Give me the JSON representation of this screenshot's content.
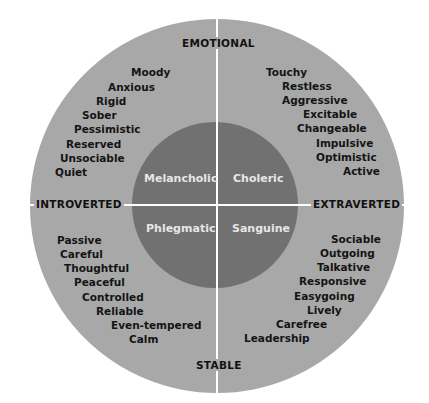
{
  "colors": {
    "outer": "#a8a8a8",
    "inner": "#717171",
    "lines": "#ffffff",
    "text": "#141414",
    "inner_text": "#e6e6e6"
  },
  "axes": {
    "top": "EMOTIONAL",
    "bottom": "STABLE",
    "left": "INTROVERTED",
    "right": "EXTRAVERTED"
  },
  "temperaments": {
    "top_left": "Melancholic",
    "top_right": "Choleric",
    "bottom_left": "Phlegmatic",
    "bottom_right": "Sanguine"
  },
  "traits": {
    "melancholic": [
      "Moody",
      "Anxious",
      "Rigid",
      "Sober",
      "Pessimistic",
      "Reserved",
      "Unsociable",
      "Quiet"
    ],
    "choleric": [
      "Touchy",
      "Restless",
      "Aggressive",
      "Excitable",
      "Changeable",
      "Impulsive",
      "Optimistic",
      "Active"
    ],
    "phlegmatic": [
      "Passive",
      "Careful",
      "Thoughtful",
      "Peaceful",
      "Controlled",
      "Reliable",
      "Even-tempered",
      "Calm"
    ],
    "sanguine": [
      "Sociable",
      "Outgoing",
      "Talkative",
      "Responsive",
      "Easygoing",
      "Lively",
      "Carefree",
      "Leadership"
    ]
  }
}
